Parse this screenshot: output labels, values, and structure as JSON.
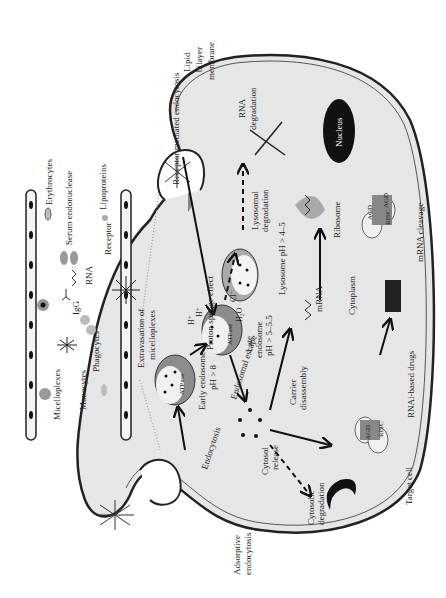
{
  "diagram": {
    "orientation": "rotated 90 degrees counter-clockwise",
    "labels": {
      "lipid_membrane": [
        "Lipid",
        "bilayer",
        "membrane"
      ],
      "receptor_mediated": "Receptor mediated endocytosis",
      "legend_erythrocytes": "Erythrocytes",
      "legend_serum": "Serum endonuclease",
      "legend_lipoproteins": "Lipoproteins",
      "legend_micelloplexes": "Micelloplexes",
      "legend_monocytes": "Monocytes",
      "legend_phagocytes": "Phagocytes",
      "legend_igg": "IgG",
      "legend_rna": "RNA",
      "legend_receptor": "Receptor",
      "extravasation": [
        "Extravasation of",
        "micelloplexes"
      ],
      "rna_degradation": [
        "RNA",
        "degradation"
      ],
      "nucleus": "Nucleus",
      "lysosomal_degradation": [
        "Lysosomal",
        "degradation"
      ],
      "lysosome_ph": "Lysosome pH > 4–5",
      "ribosome": "Ribosome",
      "mrna": "mRNA",
      "cytoplasm": "Cytoplasm",
      "mrna_cleavage": "mRNA cleavage",
      "proton_sponge": "Proton sponge effect",
      "h_plus_1": "H⁺",
      "h_plus_2": "H⁺",
      "cl_minus": "Cl⁻",
      "h2o": "H₂O",
      "atpase": "ATPase",
      "late_endosome": [
        "Late",
        "endosome",
        "pH > 5–5.5"
      ],
      "early_endosome": [
        "Early endosome",
        "pH > 8"
      ],
      "endosomal_escape": "Endosomal escape",
      "carrier_disassembly": [
        "Carrier",
        "disassembly"
      ],
      "rnai_drugs": "RNAi-based drugs",
      "agd": "AGD",
      "risc": "RISC",
      "endocytosis": "Endocytosis",
      "cytosol_release": [
        "Cytosol",
        "release"
      ],
      "cytosolic_degradation": [
        "Cytosolic",
        "degradation"
      ],
      "adsorptive": [
        "Adsorptive",
        "endocytosis"
      ],
      "target_cell": "Target cell"
    },
    "colors": {
      "cell_fill": "#e6e6e6",
      "membrane": "#222222",
      "endosome_dark": "#8c8c8c",
      "nucleus": "#111111"
    }
  }
}
